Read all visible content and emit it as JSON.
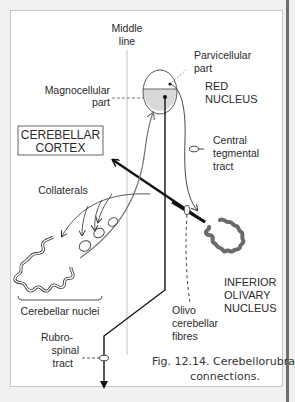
{
  "figure": {
    "caption_line1": "Fig. 12.14. Cerebellorubral",
    "caption_line2": "connections."
  },
  "labels": {
    "middle_line": [
      "Middle",
      "line"
    ],
    "parvicellular_part": [
      "Parvicellular",
      "part"
    ],
    "red_nucleus": [
      "RED",
      "NUCLEUS"
    ],
    "magnocellular_part": [
      "Magnocellular",
      "part"
    ],
    "cerebellar_cortex": [
      "CEREBELLAR",
      "CORTEX"
    ],
    "central_tegmental_tract": [
      "Central",
      "tegmental",
      "tract"
    ],
    "collaterals": "Collaterals",
    "inferior_olivary_nucleus": [
      "INFERIOR",
      "OLIVARY",
      "NUCLEUS"
    ],
    "cerebellar_nuclei": "Cerebellar nuclei",
    "olivo_cerebellar_fibres": [
      "Olivo",
      "cerebellar",
      "fibres"
    ],
    "rubrospinal_tract": [
      "Rubro-",
      "spinal",
      "tract"
    ]
  },
  "colors": {
    "panel_bg": "#ffffff",
    "page_bg": "#f1f1f1",
    "line_dark": "#111111",
    "line_gray": "#707070",
    "olive_fill": "#6a6a6a",
    "shade": "#d9d9d9"
  }
}
